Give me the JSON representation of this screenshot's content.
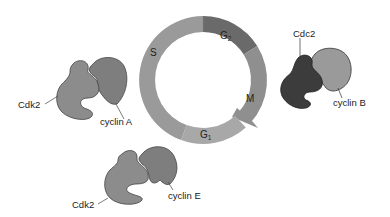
{
  "diagram": {
    "title": "",
    "cycle": {
      "phases": [
        {
          "id": "S",
          "label": "S",
          "sub": "",
          "color": "#9a9a9a"
        },
        {
          "id": "G2",
          "label": "G",
          "sub": "2",
          "color": "#6a6a6a"
        },
        {
          "id": "M",
          "label": "M",
          "sub": "",
          "color": "#8f8f8f"
        },
        {
          "id": "G1",
          "label": "G",
          "sub": "1",
          "color": "#a8a8a8"
        }
      ]
    },
    "complexes": [
      {
        "id": "cdk2-cyclinA",
        "kinase": "Cdk2",
        "cyclin": "cyclin A",
        "kinase_color": "#8c8c8c",
        "cyclin_color": "#7e7e7e"
      },
      {
        "id": "cdc2-cyclinB",
        "kinase": "Cdc2",
        "cyclin": "cyclin B",
        "kinase_color": "#3c3c3c",
        "cyclin_color": "#9a9a9a"
      },
      {
        "id": "cdk2-cyclinE",
        "kinase": "Cdk2",
        "cyclin": "cyclin E",
        "kinase_color": "#8c8c8c",
        "cyclin_color": "#7e7e7e"
      }
    ]
  }
}
